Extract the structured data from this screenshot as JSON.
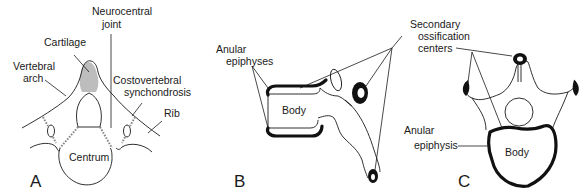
{
  "figure": {
    "panels": [
      {
        "letter": "A",
        "labels": {
          "neurocentral_joint_1": "Neurocentral",
          "neurocentral_joint_2": "joint",
          "cartilage": "Cartilage",
          "vertebral_arch_1": "Vertebral",
          "vertebral_arch_2": "arch",
          "costovertebral_1": "Costovertebral",
          "costovertebral_2": "synchondrosis",
          "rib": "Rib",
          "centrum": "Centrum"
        }
      },
      {
        "letter": "B",
        "labels": {
          "anular_epiphyses_1": "Anular",
          "anular_epiphyses_2": "epiphyses",
          "body": "Body",
          "secondary_1": "Secondary",
          "secondary_2": "ossification",
          "secondary_3": "centers"
        }
      },
      {
        "letter": "C",
        "labels": {
          "anular_epiphysis_1": "Anular",
          "anular_epiphysis_2": "epiphysis",
          "body": "Body"
        }
      }
    ],
    "colors": {
      "line": "#1a1a1a",
      "cartilage_fill": "#bdbdbd",
      "background": "#ffffff"
    }
  }
}
